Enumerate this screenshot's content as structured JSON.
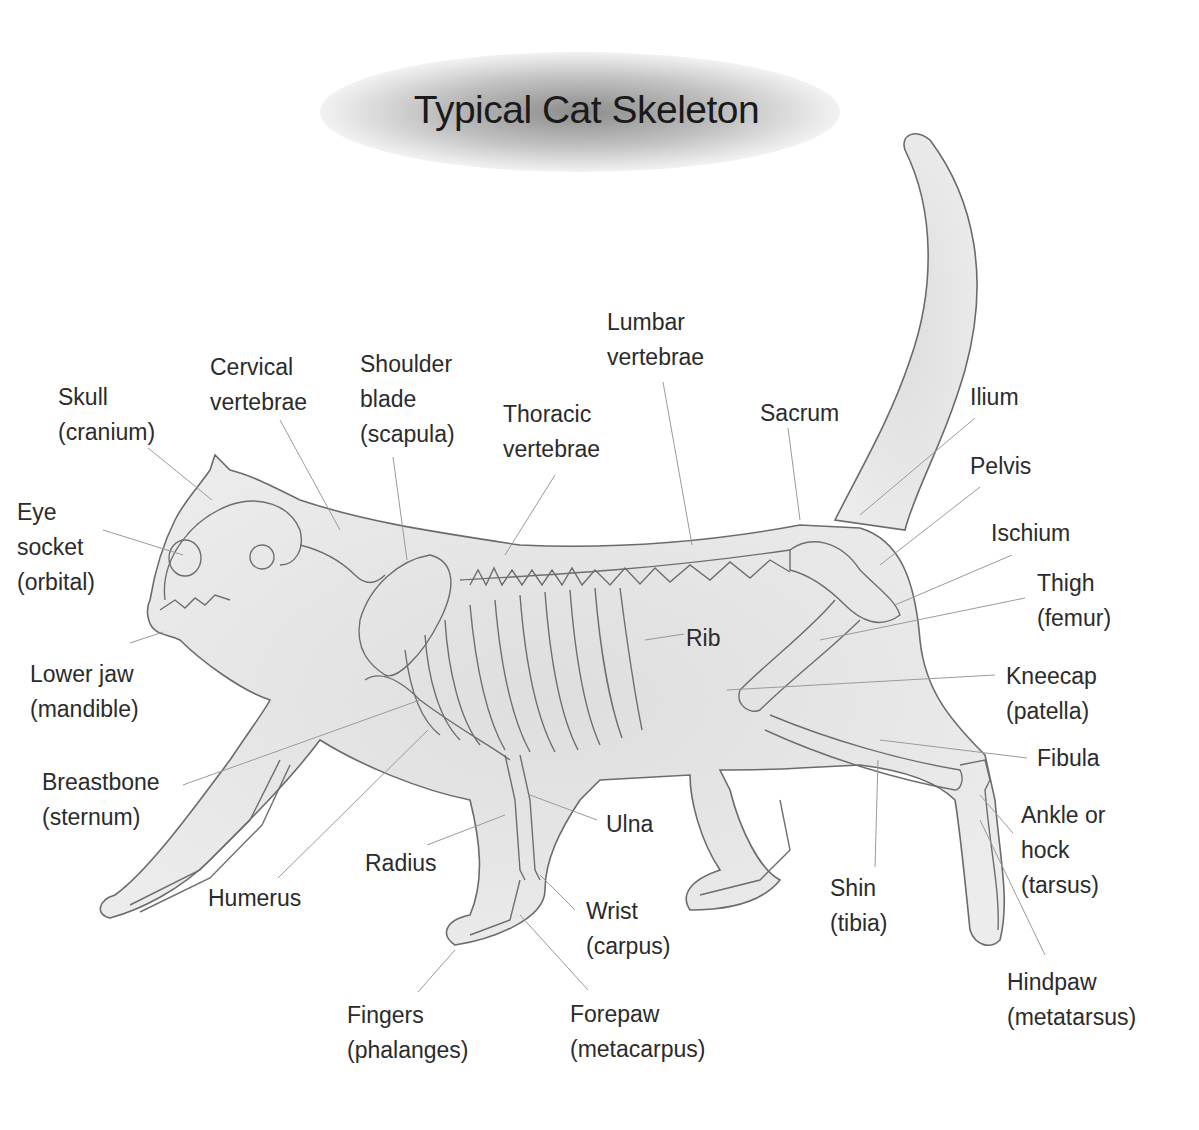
{
  "title": "Typical Cat Skeleton",
  "labels": [
    {
      "id": "skull",
      "text": "Skull\n(cranium)",
      "x": 58,
      "y": 380
    },
    {
      "id": "cervical",
      "text": "Cervical\nvertebrae",
      "x": 210,
      "y": 350
    },
    {
      "id": "shoulder",
      "text": "Shoulder\nblade\n(scapula)",
      "x": 360,
      "y": 347
    },
    {
      "id": "lumbar",
      "text": "Lumbar\nvertebrae",
      "x": 607,
      "y": 305
    },
    {
      "id": "thoracic",
      "text": "Thoracic\nvertebrae",
      "x": 503,
      "y": 397
    },
    {
      "id": "sacrum",
      "text": "Sacrum",
      "x": 760,
      "y": 396
    },
    {
      "id": "ilium",
      "text": "Ilium",
      "x": 970,
      "y": 380
    },
    {
      "id": "pelvis",
      "text": "Pelvis",
      "x": 970,
      "y": 449
    },
    {
      "id": "ischium",
      "text": "Ischium",
      "x": 991,
      "y": 516
    },
    {
      "id": "thigh",
      "text": "Thigh\n(femur)",
      "x": 1037,
      "y": 566
    },
    {
      "id": "eye",
      "text": "Eye\nsocket\n(orbital)",
      "x": 17,
      "y": 495
    },
    {
      "id": "rib",
      "text": "Rib",
      "x": 686,
      "y": 621
    },
    {
      "id": "jaw",
      "text": "Lower jaw\n(mandible)",
      "x": 30,
      "y": 657
    },
    {
      "id": "kneecap",
      "text": "Kneecap\n(patella)",
      "x": 1006,
      "y": 659
    },
    {
      "id": "fibula",
      "text": "Fibula",
      "x": 1037,
      "y": 741
    },
    {
      "id": "breastbone",
      "text": "Breastbone\n(sternum)",
      "x": 42,
      "y": 765
    },
    {
      "id": "ankle",
      "text": "Ankle or\nhock\n(tarsus)",
      "x": 1021,
      "y": 798
    },
    {
      "id": "ulna",
      "text": "Ulna",
      "x": 606,
      "y": 807
    },
    {
      "id": "radius",
      "text": "Radius",
      "x": 365,
      "y": 846
    },
    {
      "id": "humerus",
      "text": "Humerus",
      "x": 208,
      "y": 881
    },
    {
      "id": "shin",
      "text": "Shin\n(tibia)",
      "x": 830,
      "y": 871
    },
    {
      "id": "wrist",
      "text": "Wrist\n(carpus)",
      "x": 586,
      "y": 894
    },
    {
      "id": "hindpaw",
      "text": "Hindpaw\n(metatarsus)",
      "x": 1007,
      "y": 965
    },
    {
      "id": "fingers",
      "text": "Fingers\n(phalanges)",
      "x": 347,
      "y": 998
    },
    {
      "id": "forepaw",
      "text": "Forepaw\n(metacarpus)",
      "x": 570,
      "y": 997
    }
  ]
}
